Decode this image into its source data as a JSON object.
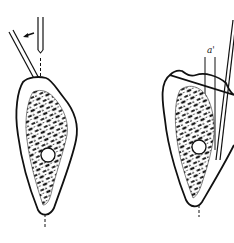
{
  "figure": {
    "panels": [
      {
        "id": "left",
        "description": "bone cross-section with angled instrument and vertical guide; arrow indicating tilt direction",
        "arrow_direction": "left"
      },
      {
        "id": "right",
        "description": "bone cross-section with instrument repositioned along vertical reference",
        "label": "a'"
      }
    ],
    "colors": {
      "ink": "#111111",
      "background": "#ffffff"
    }
  }
}
